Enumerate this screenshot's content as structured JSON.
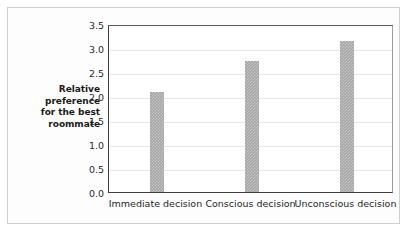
{
  "chart_data": {
    "type": "bar",
    "title": "",
    "subtitle": "",
    "xlabel": "",
    "ylabel": "Relative preference for the best roommate",
    "ylabel_lines": [
      "Relative",
      "preference",
      "for the best",
      "roommate"
    ],
    "categories": [
      "Immediate decision",
      "Conscious decision",
      "Unconscious decision"
    ],
    "values": [
      2.08,
      2.72,
      3.15
    ],
    "ylim": [
      0.0,
      3.5
    ],
    "ytick_values": [
      0.0,
      0.5,
      1.0,
      1.5,
      2.0,
      2.5,
      3.0,
      3.5
    ],
    "ytick_labels": [
      "0.0",
      "0.5",
      "1.0",
      "1.5",
      "2.0",
      "2.5",
      "3.0",
      "3.5"
    ],
    "grid": true,
    "grid_axis": "y",
    "legend": null,
    "legend_position": "none",
    "annotations": [],
    "bar_color": "#a6a6a6",
    "grid_color": "#e8e8e8",
    "axis_color": "#3d3d3d",
    "frame_color": "#cfcfcf",
    "background_color": "#fdfdfd",
    "plot_background_color": "#ffffff",
    "text_color": "#262626"
  }
}
